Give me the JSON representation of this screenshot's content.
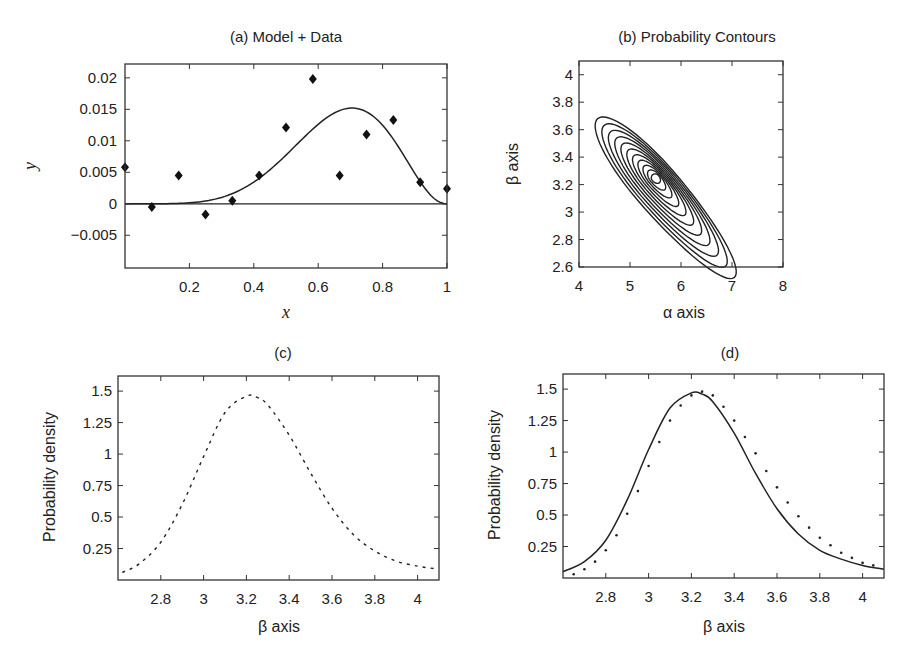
{
  "figure": {
    "panels": [
      {
        "id": "a",
        "title": "(a) Model + Data",
        "xlabel": "x",
        "ylabel": "y"
      },
      {
        "id": "b",
        "title": "(b) Probability Contours",
        "xlabel": "α axis",
        "ylabel": "β axis"
      },
      {
        "id": "c",
        "title": "(c)",
        "xlabel": "β axis",
        "ylabel": "Probability density"
      },
      {
        "id": "d",
        "title": "(d)",
        "xlabel": "β axis",
        "ylabel": "Probability density"
      }
    ]
  },
  "chart_data": [
    {
      "id": "a",
      "type": "scatter",
      "title": "(a) Model + Data",
      "xlabel": "x",
      "ylabel": "y",
      "xlim": [
        0,
        1
      ],
      "ylim": [
        -0.0102,
        0.0222
      ],
      "xticks": [
        "0.2",
        "0.4",
        "0.6",
        "0.8",
        "1"
      ],
      "xtick_values": [
        0.2,
        0.4,
        0.6,
        0.8,
        1.0
      ],
      "yticks": [
        "0.02",
        "0.015",
        "0.01",
        "0.005",
        "0",
        "-0.005"
      ],
      "ytick_values": [
        0.02,
        0.015,
        0.01,
        0.005,
        0,
        -0.005
      ],
      "grid": false,
      "series": [
        {
          "name": "Data",
          "marker": "diamond",
          "x": [
            0,
            0.0833,
            0.1667,
            0.25,
            0.3333,
            0.4167,
            0.5,
            0.5833,
            0.6667,
            0.75,
            0.8333,
            0.9167,
            1.0
          ],
          "y": [
            0.0058,
            -0.0005,
            0.0045,
            -0.0017,
            0.0005,
            0.0045,
            0.0121,
            0.0198,
            0.0045,
            0.011,
            0.0133,
            0.0034,
            0.0024
          ]
        },
        {
          "name": "Model",
          "style": "solid",
          "peak_x": 0.71,
          "peak_y": 0.0152,
          "x": [
            0,
            0.1,
            0.2,
            0.3,
            0.4,
            0.5,
            0.6,
            0.7,
            0.75,
            0.8,
            0.85,
            0.9,
            0.95,
            1.0
          ],
          "y": [
            0,
            3e-05,
            0.00035,
            0.0016,
            0.0042,
            0.0081,
            0.0124,
            0.0152,
            0.0149,
            0.0133,
            0.0105,
            0.0066,
            0.0026,
            0
          ]
        },
        {
          "name": "Zero line",
          "style": "solid",
          "y": 0
        }
      ]
    },
    {
      "id": "b",
      "type": "contour",
      "title": "(b) Probability Contours",
      "xlabel": "α axis",
      "ylabel": "β axis",
      "xlim": [
        4,
        8
      ],
      "ylim": [
        2.6,
        4.1
      ],
      "xticks": [
        "4",
        "5",
        "6",
        "7",
        "8"
      ],
      "xtick_values": [
        4,
        5,
        6,
        7,
        8
      ],
      "yticks": [
        "4",
        "3.8",
        "3.6",
        "3.4",
        "3.2",
        "3",
        "2.8",
        "2.6"
      ],
      "ytick_values": [
        4,
        3.8,
        3.6,
        3.4,
        3.2,
        3.0,
        2.8,
        2.6
      ],
      "peak": {
        "alpha": 5.5,
        "beta": 3.25
      },
      "contour_levels": 11,
      "outer_contour_extent": {
        "alpha": [
          4.45,
          7.5
        ],
        "beta": [
          2.73,
          4.03
        ]
      }
    },
    {
      "id": "c",
      "type": "line",
      "title": "(c)",
      "xlabel": "β axis",
      "ylabel": "Probability density",
      "xlim": [
        2.6,
        4.1
      ],
      "ylim": [
        0,
        1.62
      ],
      "xticks": [
        "2.8",
        "3",
        "3.2",
        "3.4",
        "3.6",
        "3.8",
        "4"
      ],
      "xtick_values": [
        2.8,
        3.0,
        3.2,
        3.4,
        3.6,
        3.8,
        4.0
      ],
      "yticks": [
        "1.5",
        "1.25",
        "1",
        "0.75",
        "0.5",
        "0.25"
      ],
      "ytick_values": [
        1.5,
        1.25,
        1.0,
        0.75,
        0.5,
        0.25
      ],
      "series": [
        {
          "name": "Marginal β (dashed)",
          "style": "dashed",
          "x": [
            2.62,
            2.7,
            2.8,
            2.9,
            3.0,
            3.1,
            3.2,
            3.25,
            3.3,
            3.4,
            3.5,
            3.6,
            3.7,
            3.8,
            3.9,
            4.0,
            4.08
          ],
          "y": [
            0.06,
            0.13,
            0.3,
            0.6,
            0.98,
            1.33,
            1.46,
            1.45,
            1.39,
            1.15,
            0.85,
            0.57,
            0.36,
            0.23,
            0.15,
            0.11,
            0.09
          ]
        }
      ]
    },
    {
      "id": "d",
      "type": "line",
      "title": "(d)",
      "xlabel": "β axis",
      "ylabel": "Probability density",
      "xlim": [
        2.6,
        4.1
      ],
      "ylim": [
        0,
        1.62
      ],
      "xticks": [
        "2.8",
        "3",
        "3.2",
        "3.4",
        "3.6",
        "3.8",
        "4"
      ],
      "xtick_values": [
        2.8,
        3.0,
        3.2,
        3.4,
        3.6,
        3.8,
        4.0
      ],
      "yticks": [
        "1.5",
        "1.25",
        "1",
        "0.75",
        "0.5",
        "0.25"
      ],
      "ytick_values": [
        1.5,
        1.25,
        1.0,
        0.75,
        0.5,
        0.25
      ],
      "series": [
        {
          "name": "Marginal β (solid)",
          "style": "solid",
          "x": [
            2.6,
            2.7,
            2.8,
            2.9,
            3.0,
            3.1,
            3.2,
            3.25,
            3.3,
            3.4,
            3.5,
            3.6,
            3.7,
            3.8,
            3.9,
            4.0,
            4.1
          ],
          "y": [
            0.05,
            0.13,
            0.3,
            0.62,
            1.02,
            1.35,
            1.47,
            1.46,
            1.4,
            1.15,
            0.83,
            0.55,
            0.35,
            0.22,
            0.15,
            0.1,
            0.07
          ]
        },
        {
          "name": "Approximation (dotted)",
          "style": "dotted",
          "x": [
            2.65,
            2.7,
            2.75,
            2.8,
            2.85,
            2.9,
            2.95,
            3.0,
            3.05,
            3.1,
            3.15,
            3.2,
            3.25,
            3.3,
            3.35,
            3.4,
            3.45,
            3.5,
            3.55,
            3.6,
            3.65,
            3.7,
            3.75,
            3.8,
            3.85,
            3.9,
            3.95,
            4.0,
            4.05
          ],
          "y": [
            0.03,
            0.07,
            0.13,
            0.22,
            0.34,
            0.51,
            0.69,
            0.89,
            1.08,
            1.25,
            1.37,
            1.45,
            1.48,
            1.45,
            1.36,
            1.25,
            1.12,
            0.99,
            0.85,
            0.72,
            0.6,
            0.49,
            0.4,
            0.32,
            0.26,
            0.2,
            0.16,
            0.12,
            0.1
          ]
        }
      ]
    }
  ]
}
